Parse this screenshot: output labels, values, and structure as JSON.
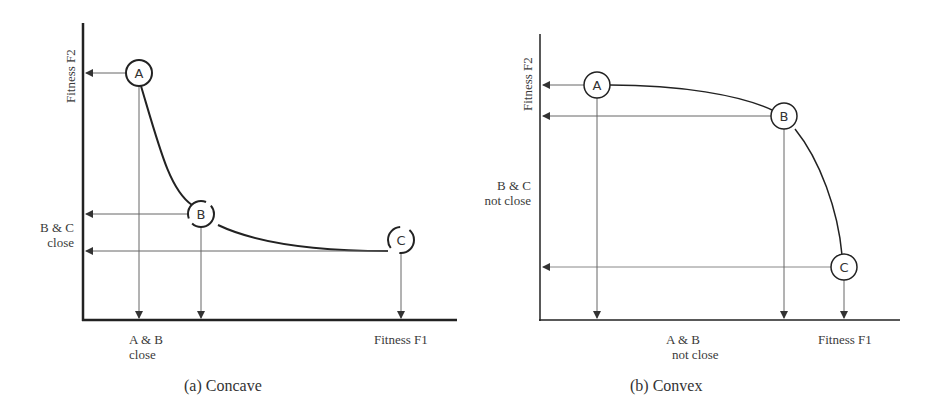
{
  "panels": [
    {
      "id": "concave",
      "caption": "(a)  Concave",
      "x_axis_label": "Fitness  F1",
      "y_axis_label": "Fitness  F2",
      "x_annotation": [
        "A & B",
        "close"
      ],
      "y_annotation": [
        "B & C",
        "close"
      ],
      "points": [
        {
          "label": "A"
        },
        {
          "label": "B"
        },
        {
          "label": "C"
        }
      ]
    },
    {
      "id": "convex",
      "caption": "(b)  Convex",
      "x_axis_label": "Fitness F1",
      "y_axis_label": "Fitness  F2",
      "x_annotation": [
        "A & B",
        "not close"
      ],
      "y_annotation": [
        "B & C",
        "not close"
      ],
      "points": [
        {
          "label": "A"
        },
        {
          "label": "B"
        },
        {
          "label": "C"
        }
      ]
    }
  ],
  "colors": {
    "line": "#2a2a2a",
    "arrow": "#555555",
    "text": "#3a3a3a"
  }
}
